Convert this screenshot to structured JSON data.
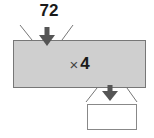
{
  "input": {
    "value": "72"
  },
  "machine": {
    "operator_symbol": "×",
    "operand": "4"
  },
  "output": {
    "value": ""
  },
  "colors": {
    "machine_fill": "#cfcfcf",
    "arrow": "#555555",
    "line": "#777777"
  }
}
